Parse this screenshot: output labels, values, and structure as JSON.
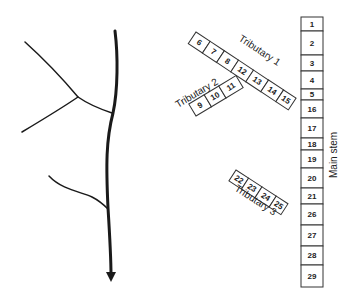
{
  "figure": {
    "left_panel": {
      "description": "Schematic river network with main stem flowing downward and three tributaries",
      "arrow_direction": "down"
    },
    "right_panel": {
      "main_stem": {
        "label": "Main stem",
        "segments": [
          "1",
          "2",
          "3",
          "4",
          "5",
          "16",
          "17",
          "18",
          "19",
          "20",
          "21",
          "26",
          "27",
          "28",
          "29"
        ]
      },
      "tributaries": [
        {
          "label": "Tributary 1",
          "segments": [
            "6",
            "7",
            "8",
            "12",
            "13",
            "14",
            "15"
          ]
        },
        {
          "label": "Tributary 2",
          "segments": [
            "9",
            "10",
            "11"
          ]
        },
        {
          "label": "Tributary 3",
          "segments": [
            "22",
            "23",
            "24",
            "25"
          ]
        }
      ]
    }
  }
}
